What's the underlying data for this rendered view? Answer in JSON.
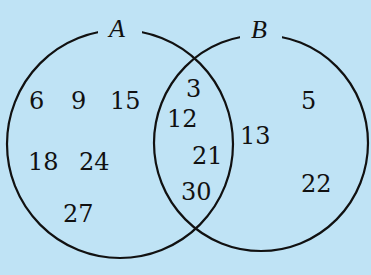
{
  "diagram": {
    "type": "venn",
    "background_color": "#bfe3f5",
    "sets": [
      {
        "name": "A",
        "label": "A"
      },
      {
        "name": "B",
        "label": "B"
      }
    ],
    "regions": {
      "A_only": [
        "6",
        "9",
        "15",
        "18",
        "24",
        "27"
      ],
      "A_and_B": [
        "3",
        "12",
        "21",
        "30"
      ],
      "B_only": [
        "5",
        "13",
        "22"
      ]
    }
  }
}
